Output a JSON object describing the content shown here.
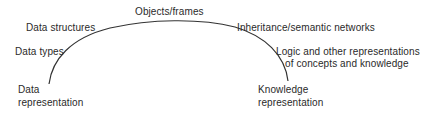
{
  "diagram": {
    "type": "spectrum-arc",
    "start": {
      "line1": "Data",
      "line2": "representation"
    },
    "end": {
      "line1": "Knowledge",
      "line2": "representation"
    },
    "arc_labels": [
      {
        "text": "Data types"
      },
      {
        "text": "Data structures"
      },
      {
        "text": "Objects/frames"
      },
      {
        "text": "Inheritance/semantic networks"
      },
      {
        "line1": "Logic and other representations",
        "line2": "of concepts and knowledge"
      }
    ],
    "colors": {
      "line": "#333333",
      "text": "#2a2a2a",
      "background": "#ffffff"
    }
  }
}
